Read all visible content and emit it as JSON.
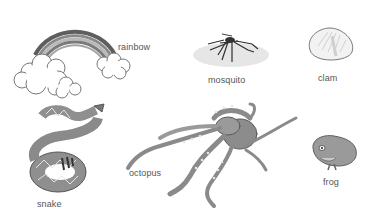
{
  "items": [
    {
      "name": "rainbow",
      "label": "rainbow"
    },
    {
      "name": "mosquito",
      "label": "mosquito"
    },
    {
      "name": "clam",
      "label": "clam"
    },
    {
      "name": "snake",
      "label": "snake"
    },
    {
      "name": "octopus",
      "label": "octopus"
    },
    {
      "name": "frog",
      "label": "frog"
    }
  ],
  "colors": {
    "background": "#ffffff",
    "label": "#555555",
    "illustration_dark": "#6e6e6e",
    "illustration_mid": "#9a9a9a",
    "illustration_light": "#d9d9d9"
  }
}
